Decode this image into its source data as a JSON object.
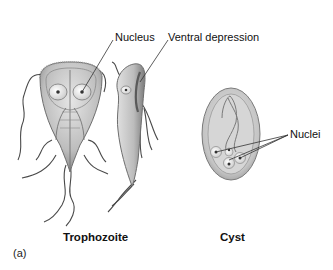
{
  "figure": {
    "panel_label": "(a)",
    "labels": {
      "nucleus": "Nucleus",
      "ventral_depression": "Ventral depression",
      "nuclei": "Nuclei"
    },
    "captions": {
      "trophozoite": "Trophozoite",
      "cyst": "Cyst"
    },
    "colors": {
      "cell_body": "#c8c8c8",
      "cell_outline": "#6e6e6e",
      "flagella": "#4a4a4a",
      "leader_line": "#333333",
      "text": "#111111",
      "background": "#ffffff"
    }
  }
}
